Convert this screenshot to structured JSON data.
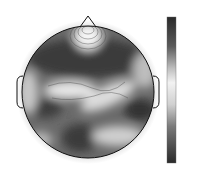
{
  "chart_data": {
    "type": "heatmap",
    "subtype": "eeg-topographic-map",
    "title": "",
    "colormap": "grayscale (dark = high, light = mid, dark = low)",
    "colorbar": {
      "min": 0.6,
      "max": 0.8,
      "ticks": [
        "0.8",
        "0.78",
        "0.76",
        "0.74",
        "0.72",
        "0.7",
        "0.68",
        "0.66",
        "0.64",
        "0.62",
        "0.6"
      ]
    },
    "electrodes": [
      {
        "name": "FP1",
        "x": 76,
        "y": 38
      },
      {
        "name": "FP2",
        "x": 106,
        "y": 28
      },
      {
        "name": "F7",
        "x": 38,
        "y": 52
      },
      {
        "name": "F3",
        "x": 60,
        "y": 57
      },
      {
        "name": "F1",
        "x": 74,
        "y": 57
      },
      {
        "name": "Fz",
        "x": 88,
        "y": 57
      },
      {
        "name": "F4",
        "x": 112,
        "y": 57
      },
      {
        "name": "F8",
        "x": 143,
        "y": 50
      },
      {
        "name": "FT7",
        "x": 28,
        "y": 68
      },
      {
        "name": "FC3",
        "x": 54,
        "y": 72
      },
      {
        "name": "FC1",
        "x": 70,
        "y": 72
      },
      {
        "name": "FCz",
        "x": 92,
        "y": 72
      },
      {
        "name": "FC4",
        "x": 124,
        "y": 72
      },
      {
        "name": "FC6",
        "x": 137,
        "y": 72
      },
      {
        "name": "FT8",
        "x": 150,
        "y": 70
      },
      {
        "name": "T7",
        "x": 24,
        "y": 90
      },
      {
        "name": "C5",
        "x": 40,
        "y": 90
      },
      {
        "name": "C3",
        "x": 54,
        "y": 90
      },
      {
        "name": "C1",
        "x": 72,
        "y": 90
      },
      {
        "name": "Cz",
        "x": 90,
        "y": 90
      },
      {
        "name": "C2",
        "x": 106,
        "y": 90
      },
      {
        "name": "C4",
        "x": 122,
        "y": 90
      },
      {
        "name": "C6",
        "x": 138,
        "y": 90
      },
      {
        "name": "T8",
        "x": 152,
        "y": 90
      },
      {
        "name": "TP7",
        "x": 26,
        "y": 107
      },
      {
        "name": "CP3",
        "x": 46,
        "y": 107
      },
      {
        "name": "CP1",
        "x": 76,
        "y": 107
      },
      {
        "name": "CPz",
        "x": 90,
        "y": 107
      },
      {
        "name": "CP2",
        "x": 104,
        "y": 107
      },
      {
        "name": "CP4",
        "x": 124,
        "y": 107
      },
      {
        "name": "CP6",
        "x": 138,
        "y": 107
      },
      {
        "name": "TP8",
        "x": 152,
        "y": 111
      },
      {
        "name": "P7",
        "x": 38,
        "y": 123
      },
      {
        "name": "P3",
        "x": 60,
        "y": 123
      },
      {
        "name": "P1",
        "x": 74,
        "y": 123
      },
      {
        "name": "Pz",
        "x": 88,
        "y": 123
      },
      {
        "name": "P2",
        "x": 104,
        "y": 123
      },
      {
        "name": "P4",
        "x": 118,
        "y": 123
      },
      {
        "name": "P6",
        "x": 130,
        "y": 126
      },
      {
        "name": "P8",
        "x": 143,
        "y": 129
      },
      {
        "name": "PO7",
        "x": 54,
        "y": 140
      },
      {
        "name": "O1",
        "x": 72,
        "y": 140
      },
      {
        "name": "Oz",
        "x": 90,
        "y": 152
      },
      {
        "name": "O2",
        "x": 110,
        "y": 140
      },
      {
        "name": "PO8",
        "x": 128,
        "y": 144
      }
    ],
    "regions": [
      {
        "description": "light peak at frontal-midline near nose",
        "approx_value": 0.72
      },
      {
        "description": "dark frontal band across F/FC rows",
        "approx_value": 0.78
      },
      {
        "description": "light central band from C3 to C4/CP2 region",
        "approx_value": 0.71
      },
      {
        "description": "dark right centro-parietal blob near CP4/TP8",
        "approx_value": 0.62
      },
      {
        "description": "dark left parietal/occipital blobs",
        "approx_value": 0.63
      }
    ],
    "xlabel": "",
    "ylabel": "",
    "legend_position": "right"
  }
}
